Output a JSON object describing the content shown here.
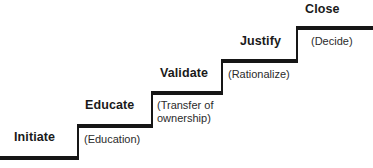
{
  "diagram": {
    "name": "sales-staircase-diagram",
    "stroke_color": "#161616",
    "background_color": "#ffffff",
    "text_color": "#1a1a1a",
    "caption_color": "#2b2b2b",
    "steps": [
      {
        "id": "initiate",
        "title": "Initiate",
        "caption": "(Education)",
        "order": 1
      },
      {
        "id": "educate",
        "title": "Educate",
        "caption": "(Transfer of ownership)",
        "caption_line_1": "(Transfer of",
        "caption_line_2": "ownership)",
        "order": 2
      },
      {
        "id": "validate",
        "title": "Validate",
        "caption": "(Rationalize)",
        "order": 3
      },
      {
        "id": "justify",
        "title": "Justify",
        "caption": "(Decide)",
        "order": 4
      },
      {
        "id": "close",
        "title": "Close",
        "caption": "",
        "order": 5
      }
    ]
  }
}
